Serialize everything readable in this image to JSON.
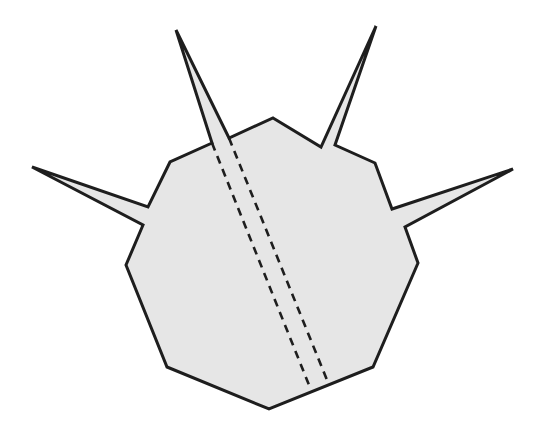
{
  "figure": {
    "colors": {
      "fill": "#e6e6e6",
      "stroke": "#1e1e1e",
      "background": "#ffffff"
    },
    "outline_points": [
      [
        273,
        118
      ],
      [
        321,
        147
      ],
      [
        376,
        26
      ],
      [
        335,
        145
      ],
      [
        375,
        163
      ],
      [
        392,
        209
      ],
      [
        513,
        169
      ],
      [
        405,
        227
      ],
      [
        418,
        263
      ],
      [
        373,
        367
      ],
      [
        269,
        409
      ],
      [
        167,
        367
      ],
      [
        126,
        265
      ],
      [
        143,
        225
      ],
      [
        32,
        167
      ],
      [
        148,
        207
      ],
      [
        170,
        162
      ],
      [
        212,
        143
      ],
      [
        176,
        30
      ],
      [
        229,
        138
      ]
    ],
    "dashed_lines": [
      {
        "from": [
          212,
          143
        ],
        "to": [
          309,
          385
        ]
      },
      {
        "from": [
          229,
          138
        ],
        "to": [
          327,
          380
        ]
      }
    ],
    "spikes": [
      "upper-left",
      "upper-right",
      "left",
      "right"
    ]
  }
}
